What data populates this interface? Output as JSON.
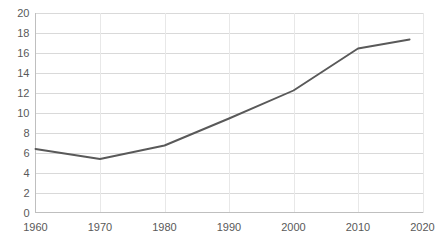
{
  "chart_data": {
    "type": "line",
    "title": "",
    "subtitle": "",
    "xlabel": "",
    "ylabel": "",
    "x": [
      1960,
      1970,
      1980,
      1990,
      2000,
      2010,
      2018
    ],
    "values": [
      6.35,
      5.35,
      6.7,
      9.4,
      12.2,
      16.4,
      17.3
    ],
    "series": [
      {
        "name": "",
        "x": [
          1960,
          1970,
          1980,
          1990,
          2000,
          2010,
          2018
        ],
        "values": [
          6.35,
          5.35,
          6.7,
          9.4,
          12.2,
          16.4,
          17.3
        ]
      }
    ],
    "xlim": [
      1960,
      2020
    ],
    "ylim": [
      0,
      20
    ],
    "x_ticks": [
      1960,
      1970,
      1980,
      1990,
      2000,
      2010,
      2020
    ],
    "x_tick_labels": [
      "1960",
      "1970",
      "1980",
      "1990",
      "2000",
      "2010",
      "2020"
    ],
    "y_ticks": [
      0,
      2,
      4,
      6,
      8,
      10,
      12,
      14,
      16,
      18,
      20
    ],
    "y_tick_labels": [
      "0",
      "2",
      "4",
      "6",
      "8",
      "10",
      "12",
      "14",
      "16",
      "18",
      "20"
    ],
    "grid": {
      "horizontal": true,
      "vertical": true
    },
    "legend": {
      "visible": false,
      "position": "none",
      "entries": []
    },
    "annotations": [],
    "colors": {
      "line": "#595959",
      "gridline_horizontal": "#d9d9d9",
      "gridline_vertical": "#e8e8e8",
      "axis": "#bfbfbf",
      "tick_label": "#595959",
      "background": "#ffffff"
    }
  }
}
